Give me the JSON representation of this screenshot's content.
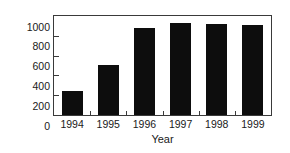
{
  "chart_data": {
    "type": "bar",
    "title": "",
    "subtitle": "",
    "xlabel": "Year",
    "ylabel": "Number",
    "categories": [
      "1994",
      "1995",
      "1996",
      "1997",
      "1998",
      "1999"
    ],
    "values": [
      240,
      510,
      880,
      930,
      915,
      905
    ],
    "series": [
      {
        "name": "Number",
        "values": [
          240,
          510,
          880,
          930,
          915,
          905
        ]
      }
    ],
    "ylim": [
      0,
      1000
    ],
    "ytick_labels": [
      "1000",
      "800",
      "600",
      "400",
      "200",
      "0"
    ],
    "ytick_values": [
      1000,
      800,
      600,
      400,
      200,
      0
    ],
    "xtick_labels": [
      "1994",
      "1995",
      "1996",
      "1997",
      "1998",
      "1999"
    ],
    "grid": false,
    "legend": false,
    "legend_position": "none",
    "annotations": [],
    "colors": {
      "bar_fill": "#0d0d0d",
      "axis": "#3a3a3a",
      "text": "#1a1a1a",
      "background": "#ffffff"
    }
  }
}
